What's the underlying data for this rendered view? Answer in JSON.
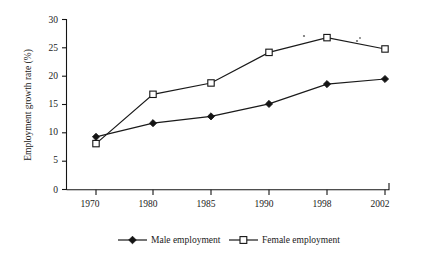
{
  "chart_data": {
    "type": "line",
    "title": "",
    "xlabel": "",
    "ylabel": "Employment growth rate (%)",
    "categories": [
      "1970",
      "1980",
      "1985",
      "1990",
      "1998",
      "2002"
    ],
    "ylim": [
      0,
      30
    ],
    "yticks": [
      "0",
      "5",
      "10",
      "15",
      "20",
      "25",
      "30"
    ],
    "grid": false,
    "legend_position": "bottom",
    "series": [
      {
        "name": "Male employment",
        "marker": "filled-diamond",
        "values": [
          9.3,
          11.7,
          12.9,
          15.1,
          18.6,
          19.5
        ]
      },
      {
        "name": "Female employment",
        "marker": "open-square",
        "values": [
          8.1,
          16.8,
          18.8,
          24.2,
          26.8,
          24.8
        ]
      }
    ]
  },
  "axes": {
    "y_title": "Employment growth rate (%)",
    "y_tick_labels": [
      "30",
      "25",
      "20",
      "15",
      "10",
      "5",
      "0"
    ],
    "x_tick_labels": [
      "1970",
      "1980",
      "1985",
      "1990",
      "1998",
      "2002"
    ]
  },
  "legend": {
    "entries": [
      {
        "label": "Male employment",
        "marker": "filled-diamond"
      },
      {
        "label": "Female employment",
        "marker": "open-square"
      }
    ]
  },
  "colors": {
    "ink": "#1a1a1a",
    "axis": "#141414",
    "line": "#1a1a1a",
    "marker_fill_male": "#141414",
    "marker_fill_female": "#ffffff",
    "background": "#ffffff",
    "speck": "#6e6e6e"
  }
}
